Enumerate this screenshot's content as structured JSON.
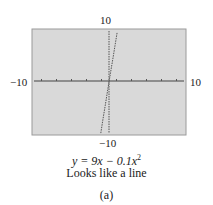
{
  "chart_data": {
    "type": "line",
    "title": "",
    "equation": "y = 9x − 0.1x²",
    "caption": "Looks like a line",
    "subfigure_label": "(a)",
    "xlabel": "",
    "ylabel": "",
    "xlim": [
      -10,
      10
    ],
    "ylim": [
      -10,
      10
    ],
    "x_tick_labels": {
      "min": "−10",
      "max": "10"
    },
    "y_tick_labels": {
      "min": "−10",
      "max": "10"
    },
    "x_tick_step": 1,
    "grid": false,
    "background": "#d9d9d9",
    "series": [
      {
        "name": "y = 9x − 0.1x^2",
        "x": [
          -1.1,
          -0.8,
          -0.5,
          -0.2,
          0,
          0.2,
          0.5,
          0.8,
          1.1
        ],
        "y": [
          -10.02,
          -7.26,
          -4.53,
          -1.8,
          0,
          1.8,
          4.48,
          7.14,
          9.78
        ]
      }
    ]
  },
  "labels": {
    "y_max": "10",
    "y_min": "−10",
    "x_min": "−10",
    "x_max": "10",
    "equation_prefix": "y = 9x − 0.1x",
    "equation_exp": "2",
    "caption": "Looks like a line",
    "subfigure": "(a)"
  }
}
